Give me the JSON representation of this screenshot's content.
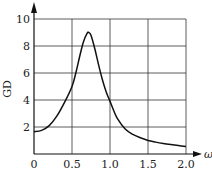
{
  "chart_data": {
    "type": "line",
    "title": "",
    "xlabel": "ω",
    "ylabel": "GD",
    "xlim": [
      0,
      2.0
    ],
    "ylim": [
      0,
      10
    ],
    "grid": true,
    "x_ticks": [
      "0",
      "0.5",
      "1.0",
      "1.5",
      "2.0"
    ],
    "y_ticks": [
      "2",
      "4",
      "6",
      "8",
      "10"
    ],
    "series": [
      {
        "name": "GD",
        "x": [
          0,
          0.1,
          0.2,
          0.3,
          0.4,
          0.5,
          0.55,
          0.6,
          0.65,
          0.7,
          0.72,
          0.75,
          0.8,
          0.85,
          0.9,
          0.95,
          1.0,
          1.05,
          1.1,
          1.2,
          1.3,
          1.4,
          1.5,
          1.6,
          1.7,
          1.8,
          1.9,
          2.0
        ],
        "values": [
          1.65,
          1.75,
          2.1,
          2.8,
          3.8,
          5.0,
          6.0,
          7.2,
          8.3,
          8.95,
          9.0,
          8.8,
          7.8,
          6.6,
          5.5,
          4.6,
          3.9,
          3.2,
          2.6,
          1.85,
          1.45,
          1.2,
          1.0,
          0.88,
          0.78,
          0.7,
          0.63,
          0.55
        ]
      }
    ]
  }
}
